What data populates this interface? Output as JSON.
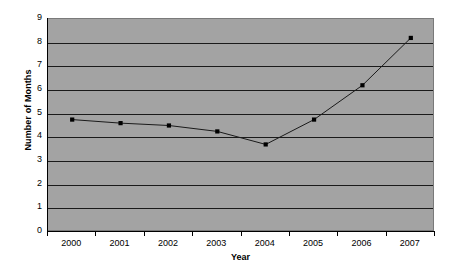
{
  "chart_data": {
    "type": "line",
    "title": "",
    "xlabel": "Year",
    "ylabel": "Number of Months",
    "categories": [
      "2000",
      "2001",
      "2002",
      "2003",
      "2004",
      "2005",
      "2006",
      "2007"
    ],
    "values": [
      4.75,
      4.6,
      4.5,
      4.25,
      3.7,
      4.75,
      6.2,
      8.2
    ],
    "series": [
      {
        "name": "Number of Months",
        "values": [
          4.75,
          4.6,
          4.5,
          4.25,
          3.7,
          4.75,
          6.2,
          8.2
        ]
      }
    ],
    "ylim": [
      0,
      9
    ],
    "y_ticks": [
      0,
      1,
      2,
      3,
      4,
      5,
      6,
      7,
      8,
      9
    ],
    "y_tick_labels": [
      "0",
      "1",
      "2",
      "3",
      "4",
      "5",
      "6",
      "7",
      "8",
      "9"
    ],
    "grid": true,
    "grid_axis": "y",
    "legend": false,
    "legend_position": "none",
    "marker": "square",
    "line_color": "#1a1a1a",
    "marker_color": "#000000",
    "plot_background_color": "#a3a3a3",
    "figure_background_color": "#ffffff",
    "gridline_color": "#1a1a1a",
    "axis_color": "#000000",
    "text_color": "#000000"
  }
}
